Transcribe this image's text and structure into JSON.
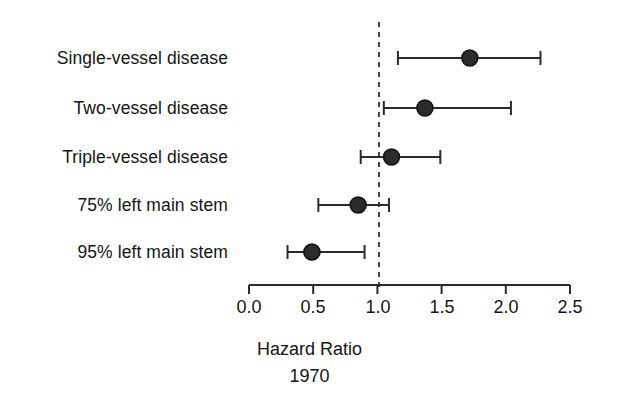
{
  "chart_data": {
    "type": "scatter",
    "subtype": "forest-plot",
    "title": "",
    "xlabel": "Hazard Ratio",
    "xlabel_sub": "1970",
    "ylabel": "",
    "xlim": [
      0.0,
      2.5
    ],
    "xticks": [
      0.0,
      0.5,
      1.0,
      1.5,
      2.0,
      2.5
    ],
    "xtick_labels": [
      "0.0",
      "0.5",
      "1.0",
      "1.5",
      "2.0",
      "2.5"
    ],
    "grid": false,
    "legend": null,
    "reference_line": {
      "value": 1.0,
      "style": "dashed",
      "color": "#444444"
    },
    "categories": [
      "Single-vessel disease",
      "Two-vessel disease",
      "Triple-vessel disease",
      "75% left main stem",
      "95% left main stem"
    ],
    "values": [
      1.72,
      1.37,
      1.11,
      0.85,
      0.49
    ],
    "ci_low": [
      1.16,
      1.05,
      0.87,
      0.54,
      0.3
    ],
    "ci_high": [
      2.27,
      2.04,
      1.49,
      1.09,
      0.9
    ],
    "points": [
      {
        "label": "Single-vessel disease",
        "hazard_ratio": 1.72,
        "ci_low": 1.16,
        "ci_high": 2.27
      },
      {
        "label": "Two-vessel disease",
        "hazard_ratio": 1.37,
        "ci_low": 1.05,
        "ci_high": 2.04
      },
      {
        "label": "Triple-vessel disease",
        "hazard_ratio": 1.11,
        "ci_low": 0.87,
        "ci_high": 1.49
      },
      {
        "label": "75% left main stem",
        "hazard_ratio": 0.85,
        "ci_low": 0.54,
        "ci_high": 1.09
      },
      {
        "label": "95% left main stem",
        "hazard_ratio": 0.49,
        "ci_low": 0.3,
        "ci_high": 0.9
      }
    ],
    "marker": {
      "shape": "circle",
      "color": "#2b2b2b",
      "size": 16
    },
    "line_color": "#2b2b2b"
  },
  "colors": {
    "background": "#ffffff",
    "foreground": "#141414",
    "marker": "#2b2b2b",
    "whisker": "#2b2b2b",
    "reference": "#444444",
    "axis": "#2b2b2b"
  }
}
